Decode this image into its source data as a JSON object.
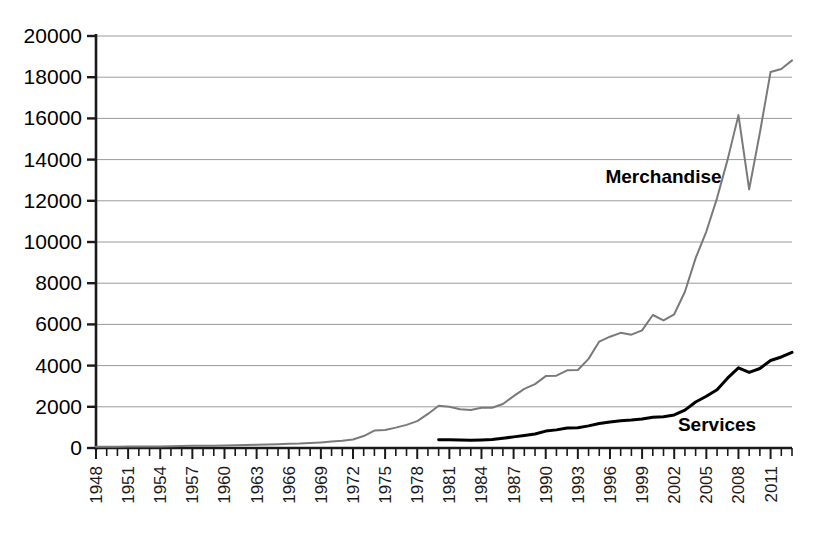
{
  "chart_data": {
    "type": "line",
    "title": "",
    "xlabel": "",
    "ylabel": "",
    "xlim": [
      1948,
      2013
    ],
    "ylim": [
      0,
      20000
    ],
    "grid": true,
    "legend_position": "inline-annotation",
    "y_ticks": [
      0,
      2000,
      4000,
      6000,
      8000,
      10000,
      12000,
      14000,
      16000,
      18000,
      20000
    ],
    "y_tick_labels": [
      "0",
      "2000",
      "4000",
      "6000",
      "8000",
      "10000",
      "12000",
      "14000",
      "16000",
      "18000",
      "20000"
    ],
    "x_tick_labels": [
      "1948",
      "1951",
      "1954",
      "1957",
      "1960",
      "1963",
      "1966",
      "1969",
      "1972",
      "1975",
      "1978",
      "1981",
      "1984",
      "1987",
      "1990",
      "1993",
      "1996",
      "1999",
      "2002",
      "2005",
      "2008",
      "2011"
    ],
    "x_tick_label_step": 3,
    "x_minor_tick_step": 1,
    "series": [
      {
        "name": "Merchandise",
        "color": "#7a7a7a",
        "width": 2,
        "annotation": "Merchandise",
        "annotation_x": 2001,
        "annotation_y": 12850,
        "x": [
          1948,
          1949,
          1950,
          1951,
          1952,
          1953,
          1954,
          1955,
          1956,
          1957,
          1958,
          1959,
          1960,
          1961,
          1962,
          1963,
          1964,
          1965,
          1966,
          1967,
          1968,
          1969,
          1970,
          1971,
          1972,
          1973,
          1974,
          1975,
          1976,
          1977,
          1978,
          1979,
          1980,
          1981,
          1982,
          1983,
          1984,
          1985,
          1986,
          1987,
          1988,
          1989,
          1990,
          1991,
          1992,
          1993,
          1994,
          1995,
          1996,
          1997,
          1998,
          1999,
          2000,
          2001,
          2002,
          2003,
          2004,
          2005,
          2006,
          2007,
          2008,
          2009,
          2010,
          2011,
          2012,
          2013
        ],
        "values": [
          59,
          62,
          62,
          77,
          78,
          77,
          77,
          84,
          94,
          108,
          108,
          115,
          127,
          134,
          141,
          154,
          172,
          187,
          204,
          215,
          239,
          273,
          317,
          350,
          415,
          579,
          844,
          877,
          990,
          1124,
          1303,
          1654,
          2049,
          2003,
          1884,
          1849,
          1950,
          1954,
          2138,
          2519,
          2869,
          3103,
          3490,
          3513,
          3772,
          3787,
          4327,
          5168,
          5403,
          5591,
          5501,
          5713,
          6456,
          6191,
          6492,
          7586,
          9218,
          10509,
          12131,
          14023,
          16159,
          12555,
          15301,
          18255,
          18401,
          18816
        ],
        "note": "World merchandise exports, billions of US dollars"
      },
      {
        "name": "Services",
        "color": "#000000",
        "width": 3,
        "annotation": "Services",
        "annotation_x": 2006,
        "annotation_y": 830,
        "x": [
          1980,
          1981,
          1982,
          1983,
          1984,
          1985,
          1986,
          1987,
          1988,
          1989,
          1990,
          1991,
          1992,
          1993,
          1994,
          1995,
          1996,
          1997,
          1998,
          1999,
          2000,
          2001,
          2002,
          2003,
          2004,
          2005,
          2006,
          2007,
          2008,
          2009,
          2010,
          2011,
          2012,
          2013
        ],
        "values": [
          402,
          400,
          385,
          375,
          390,
          410,
          470,
          540,
          610,
          680,
          820,
          880,
          975,
          985,
          1075,
          1190,
          1265,
          1325,
          1355,
          1410,
          1495,
          1520,
          1605,
          1840,
          2235,
          2510,
          2830,
          3400,
          3890,
          3670,
          3860,
          4250,
          4420,
          4645
        ],
        "note": "World commercial services exports, billions of US dollars"
      }
    ]
  },
  "axes": {
    "x_axis_name": "year-axis",
    "y_axis_name": "value-axis"
  }
}
